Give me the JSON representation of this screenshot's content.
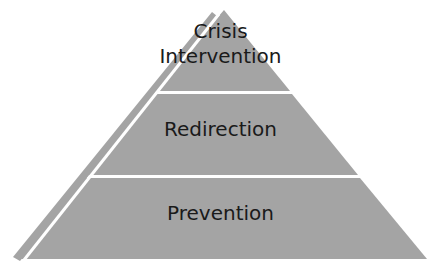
{
  "diagram": {
    "type": "pyramid",
    "colors": {
      "fill": "#a4a4a4",
      "divider": "#ffffff",
      "text": "#1a1a1a",
      "background": "#ffffff"
    },
    "levels": [
      {
        "position": "top",
        "label_line1": "Crisis",
        "label_line2": "Intervention"
      },
      {
        "position": "middle",
        "label": "Redirection"
      },
      {
        "position": "bottom",
        "label": "Prevention"
      }
    ]
  }
}
